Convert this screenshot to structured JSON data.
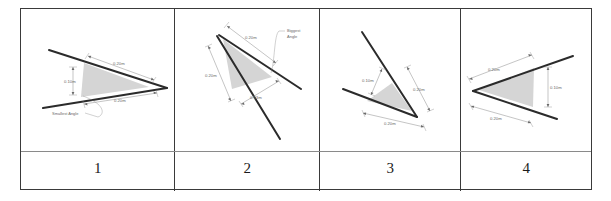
{
  "figure": {
    "kind": "geometry-worksheet-table",
    "columns": 4,
    "triangle_fill": "#d5d5d5",
    "line_color": "#2b2b2b",
    "dimension_color": "#7a7a7a",
    "border_color": "#3a3a3a"
  },
  "cells": [
    {
      "number": "1",
      "dimensions": [
        {
          "name": "height",
          "value": "0.10m"
        },
        {
          "name": "upper-side",
          "value": "0.20m"
        },
        {
          "name": "lower-side",
          "value": "0.20m"
        }
      ],
      "notes": [
        {
          "name": "angle-callout",
          "value": "Smallest Angle"
        }
      ]
    },
    {
      "number": "2",
      "dimensions": [
        {
          "name": "upper-side",
          "value": "0.20m"
        },
        {
          "name": "left-side",
          "value": "0.20m"
        },
        {
          "name": "short-side",
          "value": "0.13m"
        }
      ],
      "notes": [
        {
          "name": "angle-callout-line1",
          "value": "Biggest"
        },
        {
          "name": "angle-callout-line2",
          "value": "Angle"
        }
      ]
    },
    {
      "number": "3",
      "dimensions": [
        {
          "name": "short-side",
          "value": "0.10m"
        },
        {
          "name": "right-side",
          "value": "0.20m"
        },
        {
          "name": "bottom-side",
          "value": "0.20m"
        }
      ],
      "notes": []
    },
    {
      "number": "4",
      "dimensions": [
        {
          "name": "upper-side",
          "value": "0.20m"
        },
        {
          "name": "lower-side",
          "value": "0.20m"
        },
        {
          "name": "height",
          "value": "0.10m"
        }
      ],
      "notes": []
    }
  ]
}
